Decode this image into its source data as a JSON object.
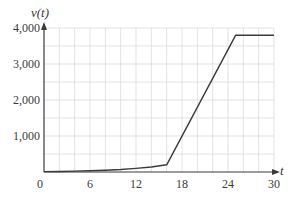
{
  "chart_data": {
    "type": "line",
    "title": "",
    "xlabel": "t",
    "ylabel": "v(t)",
    "xlim": [
      0,
      30
    ],
    "ylim": [
      0,
      4000
    ],
    "x_ticks": [
      0,
      6,
      12,
      18,
      24,
      30
    ],
    "x_tick_labels": [
      "0",
      "6",
      "12",
      "18",
      "24",
      "30"
    ],
    "y_ticks": [
      1000,
      2000,
      3000,
      4000
    ],
    "y_tick_labels": [
      "1,000",
      "2,000",
      "3,000",
      "4,000"
    ],
    "grid": true,
    "grid_x_step": 2,
    "grid_y_step": 500,
    "legend": null,
    "series": [
      {
        "name": "v(t)",
        "color": "#3a3a3a",
        "x": [
          0,
          2,
          4,
          6,
          8,
          10,
          12,
          14,
          16,
          25,
          30
        ],
        "values": [
          10,
          15,
          25,
          35,
          50,
          70,
          100,
          140,
          200,
          3800,
          3800
        ]
      }
    ]
  },
  "labels": {
    "y_axis_title": "v(t)",
    "x_axis_title": "t",
    "origin": "0"
  },
  "colors": {
    "axis": "#3a3a3a",
    "grid": "#dcdcdc",
    "line": "#3a3a3a",
    "text": "#3a3a3a"
  }
}
